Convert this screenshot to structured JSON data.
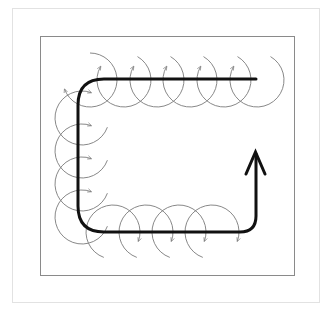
{
  "diagram": {
    "type": "path-with-looping-arcs",
    "colors": {
      "background": "#ffffff",
      "outer_frame": "#e2e2e2",
      "inner_frame": "#8a8a8a",
      "main_path": "#111111",
      "arcs": "#7a7a7a"
    },
    "inner_frame": {
      "x": 40,
      "y": 36,
      "width": 254,
      "height": 239
    },
    "main_path": {
      "points": [
        [
          256,
          79
        ],
        [
          104,
          79
        ],
        [
          78,
          105
        ],
        [
          78,
          206
        ],
        [
          104,
          232
        ],
        [
          240,
          232
        ],
        [
          256,
          216
        ],
        [
          256,
          153
        ]
      ],
      "stroke_width": 3,
      "arrowhead": {
        "tip": [
          255,
          152
        ],
        "left": [
          246,
          174
        ],
        "right": [
          264,
          174
        ]
      }
    },
    "arc_radius": 27,
    "top_row_arc_centers": [
      [
        90,
        80
      ],
      [
        124,
        80
      ],
      [
        157,
        80
      ],
      [
        190,
        80
      ],
      [
        224,
        80
      ],
      [
        257,
        80
      ]
    ],
    "left_column_arc_centers": [
      [
        82,
        118
      ],
      [
        82,
        151
      ],
      [
        82,
        184
      ],
      [
        82,
        217
      ]
    ],
    "bottom_row_arc_centers": [
      [
        113,
        232
      ],
      [
        146,
        232
      ],
      [
        179,
        232
      ],
      [
        212,
        232
      ]
    ]
  }
}
